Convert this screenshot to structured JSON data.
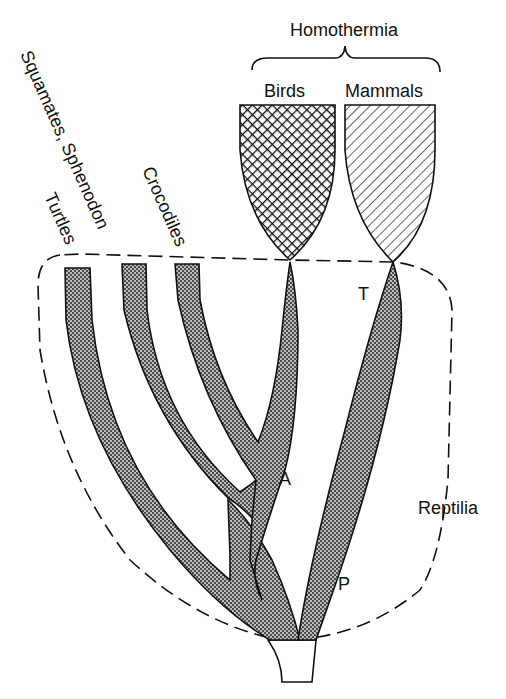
{
  "diagram": {
    "type": "phylogenetic-tree",
    "group_labels": {
      "homothermia": "Homothermia",
      "reptilia": "Reptilia"
    },
    "taxa": [
      {
        "id": "turtles",
        "label": "Turtles",
        "fill": "stipple"
      },
      {
        "id": "squamates",
        "label": "Squamates, Sphenodon",
        "fill": "stipple"
      },
      {
        "id": "crocodiles",
        "label": "Crocodiles",
        "fill": "stipple"
      },
      {
        "id": "birds",
        "label": "Birds",
        "fill": "crosshatch"
      },
      {
        "id": "mammals",
        "label": "Mammals",
        "fill": "diagonal-hatch"
      }
    ],
    "node_labels": {
      "A": "A",
      "T": "T",
      "P": "P"
    },
    "colors": {
      "ink": "#111111",
      "stipple_bg": "#9a9a9a",
      "background": "#ffffff"
    }
  }
}
